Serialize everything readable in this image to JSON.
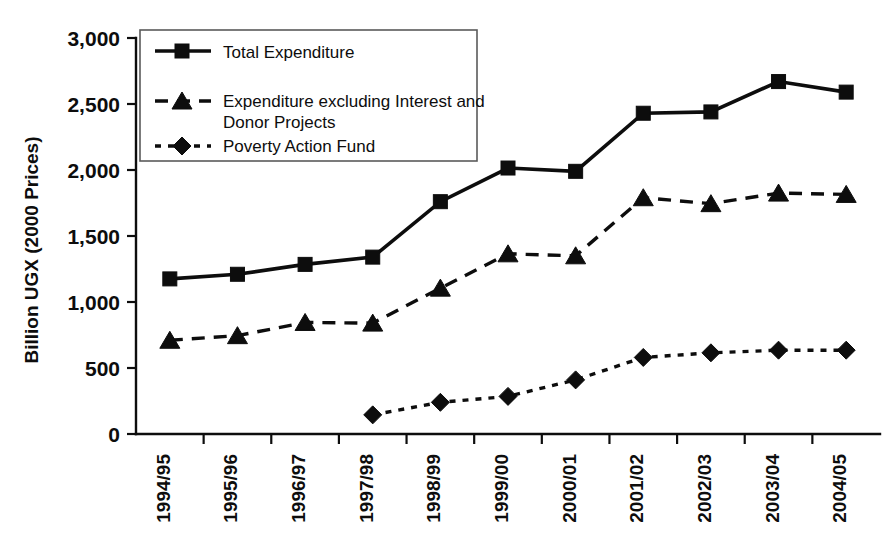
{
  "chart_data": {
    "type": "line",
    "title": "",
    "xlabel": "",
    "ylabel": "Billion UGX (2000 Prices)",
    "ylim": [
      0,
      3000
    ],
    "ytick_values": [
      0,
      500,
      1000,
      1500,
      2000,
      2500,
      3000
    ],
    "ytick_labels": [
      "0",
      "500",
      "1,000",
      "1,500",
      "2,000",
      "2,500",
      "3,000"
    ],
    "grid": false,
    "legend_position": "top-left-inside",
    "categories": [
      "1994/95",
      "1995/96",
      "1996/97",
      "1997/98",
      "1998/99",
      "1999/00",
      "2000/01",
      "2001/02",
      "2002/03",
      "2003/04",
      "2004/05"
    ],
    "series": [
      {
        "name": "Total Expenditure",
        "marker": "square",
        "line_style": "solid",
        "color": "#0d0d0d",
        "values": [
          1175,
          1210,
          1285,
          1340,
          1760,
          2015,
          1990,
          2430,
          2440,
          2670,
          2590
        ]
      },
      {
        "name": "Expenditure excluding Interest and Donor Projects",
        "marker": "triangle",
        "line_style": "dashed",
        "color": "#0d0d0d",
        "values": [
          710,
          745,
          845,
          840,
          1105,
          1365,
          1350,
          1790,
          1745,
          1825,
          1815
        ]
      },
      {
        "name": "Poverty Action Fund",
        "marker": "diamond",
        "line_style": "dotted",
        "color": "#0d0d0d",
        "values": [
          null,
          null,
          null,
          145,
          240,
          285,
          410,
          580,
          615,
          635,
          635
        ]
      }
    ]
  },
  "legend": {
    "entries": [
      {
        "label": "Total Expenditure"
      },
      {
        "label": "Expenditure excluding Interest and"
      },
      {
        "label": "Donor Projects"
      },
      {
        "label": "Poverty Action Fund"
      }
    ]
  },
  "axis": {
    "y_title": "Billion UGX (2000 Prices)"
  }
}
